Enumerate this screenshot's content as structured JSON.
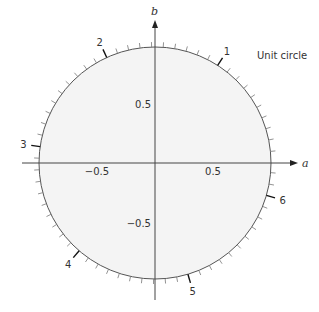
{
  "title": "Unit circle",
  "axes": {
    "x_label": "a",
    "y_label": "b",
    "x_ticks": [
      {
        "value": -0.5,
        "label": "−0.5"
      },
      {
        "value": 0.5,
        "label": "0.5"
      }
    ],
    "y_ticks": [
      {
        "value": 0.5,
        "label": "0.5"
      },
      {
        "value": -0.5,
        "label": "−0.5"
      }
    ]
  },
  "circle": {
    "radius": 1,
    "fill": "#f4f4f4",
    "stroke": "#555555",
    "minor_tick_step_radians": 0.1,
    "major_tick_labels": [
      "1",
      "2",
      "3",
      "4",
      "5",
      "6"
    ]
  },
  "chart_data": {
    "type": "diagram",
    "title": "Unit circle",
    "xlabel": "a",
    "ylabel": "b",
    "xlim": [
      -1.3,
      1.3
    ],
    "ylim": [
      -1.2,
      1.2
    ],
    "circle": {
      "center": [
        0,
        0
      ],
      "radius": 1
    },
    "tick_marks_radians_step": 0.1,
    "labeled_angles_radians": [
      1,
      2,
      3,
      4,
      5,
      6
    ],
    "axis_tick_labels": {
      "x": [
        -0.5,
        0.5
      ],
      "y": [
        0.5,
        -0.5
      ]
    }
  }
}
